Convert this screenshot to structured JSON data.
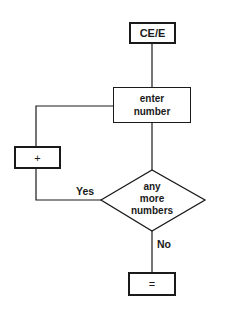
{
  "diagram": {
    "type": "flowchart",
    "title": "",
    "colors": {
      "stroke": "#1a1a1a",
      "background": "#ffffff"
    },
    "nodes": [
      {
        "id": "start",
        "shape": "rect-thick",
        "label": "CE/E"
      },
      {
        "id": "enter",
        "shape": "rect",
        "label_line1": "enter",
        "label_line2": "number"
      },
      {
        "id": "plus",
        "shape": "rect-thick",
        "label": "+"
      },
      {
        "id": "decision",
        "shape": "diamond",
        "label_line1": "any",
        "label_line2": "more",
        "label_line3": "numbers"
      },
      {
        "id": "equals",
        "shape": "rect-thick",
        "label": "="
      }
    ],
    "edges": [
      {
        "from": "start",
        "to": "enter",
        "label": ""
      },
      {
        "from": "enter",
        "to": "decision",
        "label": ""
      },
      {
        "from": "decision",
        "to": "plus",
        "label": "Yes"
      },
      {
        "from": "plus",
        "to": "enter",
        "label": ""
      },
      {
        "from": "decision",
        "to": "equals",
        "label": "No"
      }
    ],
    "edge_labels": {
      "yes": "Yes",
      "no": "No"
    }
  }
}
